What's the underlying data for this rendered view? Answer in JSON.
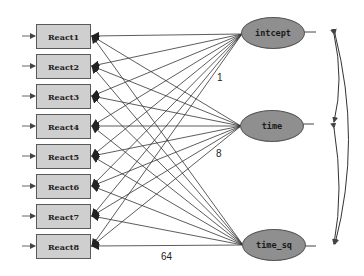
{
  "diagram": {
    "type": "path-diagram",
    "observed": [
      {
        "label": "React1"
      },
      {
        "label": "React2"
      },
      {
        "label": "React3"
      },
      {
        "label": "React4"
      },
      {
        "label": "React5"
      },
      {
        "label": "React6"
      },
      {
        "label": "React7"
      },
      {
        "label": "React8"
      }
    ],
    "latent": [
      {
        "label": "intcept"
      },
      {
        "label": "time"
      },
      {
        "label": "time_sq"
      }
    ],
    "path_labels": [
      {
        "text": "1",
        "from": "intcept"
      },
      {
        "text": "8",
        "from": "time"
      },
      {
        "text": "64",
        "from": "time_sq"
      }
    ],
    "colors": {
      "box_fill": "#cfcfcf",
      "ellipse_fill": "#8f8f8f",
      "line": "#333333"
    }
  }
}
